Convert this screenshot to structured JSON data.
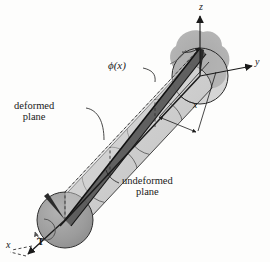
{
  "figure": {
    "name": "torsion-of-circular-shaft-diagram",
    "background_color": "#fdfdfc",
    "ink_color": "#1a1a1a"
  },
  "axes": {
    "z": {
      "label": "z"
    },
    "y": {
      "label": "y"
    },
    "x": {
      "label": "x"
    }
  },
  "dimension": {
    "label": "x"
  },
  "annotations": {
    "twist_angle": "ϕ(x)",
    "deformed_plane_line1": "deformed",
    "deformed_plane_line2": "plane",
    "undeformed_plane_line1": "undeformed",
    "undeformed_plane_line2": "plane",
    "torque": "T"
  },
  "colors": {
    "shaft_body": "#c9c9c9",
    "shaft_body_light": "#d8d8d8",
    "end_cap": "#9d9d9d",
    "far_cap": "#a8a8a8",
    "shadow_blob": "#a5a5a5",
    "radial_line_dark": "#3a3a3a",
    "outline": "#1a1a1a",
    "dashed": "#2a2a2a"
  }
}
